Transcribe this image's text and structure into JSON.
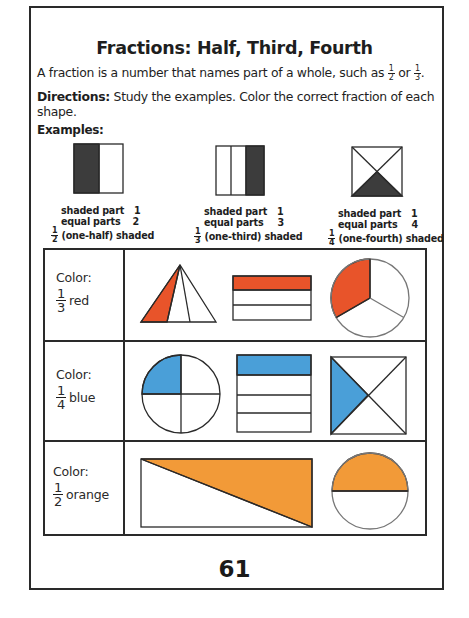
{
  "worksheet": {
    "title": "Fractions: Half, Third, Fourth",
    "intro": {
      "text": "A fraction is a number that names part of a whole, such as",
      "fraction_a": {
        "numerator": "1",
        "denominator": "2"
      },
      "connector": "or",
      "fraction_b": {
        "numerator": "1",
        "denominator": "3"
      },
      "end": "."
    },
    "directions": {
      "label": "Directions:",
      "text": " Study the examples. Color the correct fraction of each shape."
    },
    "examples_label": "Examples:",
    "examples": [
      {
        "shape": "square-halves",
        "shaded_label": "shaded part",
        "shaded_value": "1",
        "parts_label": "equal parts",
        "parts_value": "2",
        "fraction": {
          "numerator": "1",
          "denominator": "2"
        },
        "caption": "(one-half) shaded"
      },
      {
        "shape": "rectangle-thirds",
        "shaded_label": "shaded part",
        "shaded_value": "1",
        "parts_label": "equal parts",
        "parts_value": "3",
        "fraction": {
          "numerator": "1",
          "denominator": "3"
        },
        "caption": "(one-third) shaded"
      },
      {
        "shape": "square-diagonal-fourths",
        "shaded_label": "shaded part",
        "shaded_value": "1",
        "parts_label": "equal parts",
        "parts_value": "4",
        "fraction": {
          "numerator": "1",
          "denominator": "4"
        },
        "caption": "(one-fourth) shaded"
      }
    ],
    "exercises": [
      {
        "prompt": "Color:",
        "fraction": {
          "numerator": "1",
          "denominator": "3"
        },
        "color_name": "red",
        "color_hex": "#e8542a",
        "shapes": [
          "triangle-thirds",
          "rectangle-thirds-horizontal",
          "circle-thirds"
        ]
      },
      {
        "prompt": "Color:",
        "fraction": {
          "numerator": "1",
          "denominator": "4"
        },
        "color_name": "blue",
        "color_hex": "#4a9fd8",
        "shapes": [
          "circle-quarters",
          "rectangle-fourths-horizontal",
          "square-diagonal-fourths"
        ]
      },
      {
        "prompt": "Color:",
        "fraction": {
          "numerator": "1",
          "denominator": "2"
        },
        "color_name": "orange",
        "color_hex": "#f29a38",
        "shapes": [
          "rectangle-diagonal-halves",
          "circle-halves"
        ]
      }
    ],
    "example_shade_hex": "#3c3c3c",
    "page_number": "61"
  }
}
